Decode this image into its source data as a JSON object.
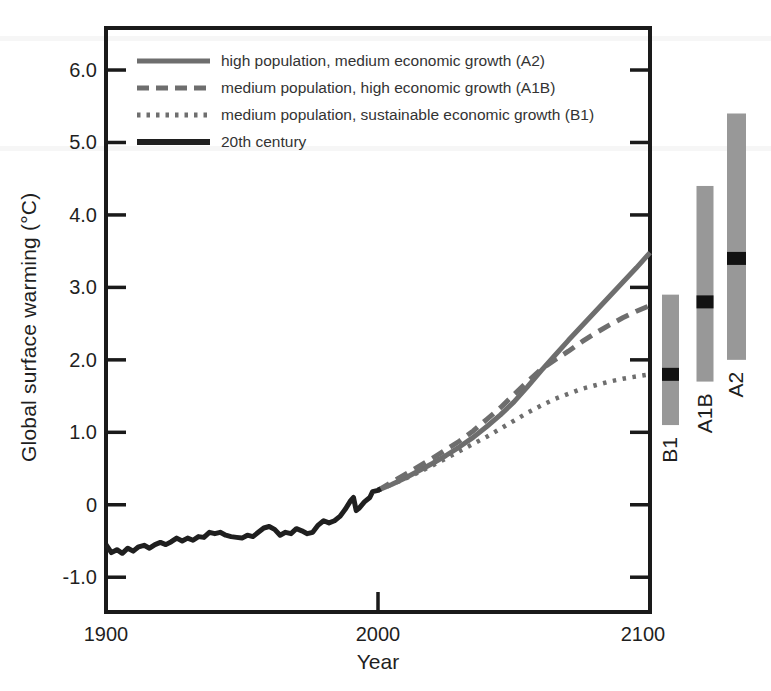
{
  "figure": {
    "background": "#ffffff",
    "axis_color": "#1a1a1a",
    "text_color": "#1f1f1f"
  },
  "axes": {
    "x_tick_labels": [
      "1900",
      "2000",
      "2100"
    ],
    "y_tick_labels": [
      "-1.0",
      "0",
      "1.0",
      "2.0",
      "3.0",
      "4.0",
      "5.0",
      "6.0"
    ]
  },
  "chart_data": {
    "type": "line",
    "title": "",
    "xlabel": "Year",
    "ylabel": "Global surface warming (°C)",
    "xlim": [
      1900,
      2100
    ],
    "ylim": [
      -1.48,
      6.58
    ],
    "x_ticks": [
      1900,
      2000,
      2100
    ],
    "y_ticks": [
      -1,
      0,
      1,
      2,
      3,
      4,
      5,
      6
    ],
    "grid": false,
    "legend_position": "top-left-inside",
    "series": [
      {
        "name": "A2",
        "label": "high population, medium economic growth (A2)",
        "style": "solid",
        "color": "#6e6e6e",
        "stroke_width": 5,
        "points": [
          [
            2000,
            0.2
          ],
          [
            2005,
            0.28
          ],
          [
            2010,
            0.37
          ],
          [
            2015,
            0.47
          ],
          [
            2020,
            0.57
          ],
          [
            2025,
            0.68
          ],
          [
            2030,
            0.8
          ],
          [
            2035,
            0.93
          ],
          [
            2040,
            1.08
          ],
          [
            2045,
            1.24
          ],
          [
            2050,
            1.42
          ],
          [
            2055,
            1.63
          ],
          [
            2060,
            1.85
          ],
          [
            2065,
            2.06
          ],
          [
            2070,
            2.27
          ],
          [
            2075,
            2.47
          ],
          [
            2080,
            2.67
          ],
          [
            2085,
            2.87
          ],
          [
            2090,
            3.07
          ],
          [
            2095,
            3.27
          ],
          [
            2100,
            3.48
          ]
        ]
      },
      {
        "name": "A1B",
        "label": "medium population, high economic growth (A1B)",
        "style": "dashed",
        "color": "#6e6e6e",
        "stroke_width": 5,
        "points": [
          [
            2000,
            0.2
          ],
          [
            2005,
            0.31
          ],
          [
            2010,
            0.42
          ],
          [
            2015,
            0.53
          ],
          [
            2020,
            0.64
          ],
          [
            2025,
            0.76
          ],
          [
            2030,
            0.88
          ],
          [
            2035,
            1.02
          ],
          [
            2040,
            1.18
          ],
          [
            2045,
            1.34
          ],
          [
            2050,
            1.52
          ],
          [
            2055,
            1.7
          ],
          [
            2060,
            1.87
          ],
          [
            2065,
            2.0
          ],
          [
            2070,
            2.12
          ],
          [
            2075,
            2.25
          ],
          [
            2080,
            2.37
          ],
          [
            2085,
            2.48
          ],
          [
            2090,
            2.58
          ],
          [
            2095,
            2.67
          ],
          [
            2100,
            2.75
          ]
        ]
      },
      {
        "name": "B1",
        "label": "medium population, sustainable economic growth (B1)",
        "style": "dotted",
        "color": "#6e6e6e",
        "stroke_width": 4.5,
        "points": [
          [
            2000,
            0.2
          ],
          [
            2005,
            0.28
          ],
          [
            2010,
            0.36
          ],
          [
            2015,
            0.45
          ],
          [
            2020,
            0.54
          ],
          [
            2025,
            0.64
          ],
          [
            2030,
            0.74
          ],
          [
            2035,
            0.84
          ],
          [
            2040,
            0.94
          ],
          [
            2045,
            1.05
          ],
          [
            2050,
            1.16
          ],
          [
            2055,
            1.27
          ],
          [
            2060,
            1.37
          ],
          [
            2065,
            1.46
          ],
          [
            2070,
            1.53
          ],
          [
            2075,
            1.6
          ],
          [
            2080,
            1.65
          ],
          [
            2085,
            1.7
          ],
          [
            2090,
            1.74
          ],
          [
            2095,
            1.77
          ],
          [
            2100,
            1.8
          ]
        ]
      },
      {
        "name": "20th century",
        "label": "20th century",
        "style": "solid",
        "color": "#1f1f1f",
        "stroke_width": 5,
        "points": [
          [
            1900,
            -0.55
          ],
          [
            1902,
            -0.66
          ],
          [
            1904,
            -0.62
          ],
          [
            1906,
            -0.67
          ],
          [
            1908,
            -0.6
          ],
          [
            1910,
            -0.64
          ],
          [
            1912,
            -0.58
          ],
          [
            1914,
            -0.56
          ],
          [
            1916,
            -0.6
          ],
          [
            1918,
            -0.55
          ],
          [
            1920,
            -0.52
          ],
          [
            1922,
            -0.55
          ],
          [
            1924,
            -0.51
          ],
          [
            1926,
            -0.46
          ],
          [
            1928,
            -0.5
          ],
          [
            1930,
            -0.46
          ],
          [
            1932,
            -0.49
          ],
          [
            1934,
            -0.44
          ],
          [
            1936,
            -0.45
          ],
          [
            1938,
            -0.38
          ],
          [
            1940,
            -0.4
          ],
          [
            1942,
            -0.38
          ],
          [
            1944,
            -0.42
          ],
          [
            1946,
            -0.44
          ],
          [
            1948,
            -0.45
          ],
          [
            1950,
            -0.46
          ],
          [
            1952,
            -0.42
          ],
          [
            1954,
            -0.44
          ],
          [
            1956,
            -0.38
          ],
          [
            1958,
            -0.32
          ],
          [
            1960,
            -0.3
          ],
          [
            1962,
            -0.34
          ],
          [
            1964,
            -0.42
          ],
          [
            1966,
            -0.38
          ],
          [
            1968,
            -0.4
          ],
          [
            1970,
            -0.33
          ],
          [
            1972,
            -0.36
          ],
          [
            1974,
            -0.4
          ],
          [
            1976,
            -0.38
          ],
          [
            1978,
            -0.28
          ],
          [
            1980,
            -0.22
          ],
          [
            1982,
            -0.25
          ],
          [
            1984,
            -0.22
          ],
          [
            1986,
            -0.16
          ],
          [
            1988,
            -0.06
          ],
          [
            1990,
            0.06
          ],
          [
            1991,
            0.1
          ],
          [
            1992,
            -0.08
          ],
          [
            1993,
            -0.05
          ],
          [
            1995,
            0.04
          ],
          [
            1997,
            0.1
          ],
          [
            1998,
            0.18
          ],
          [
            2000,
            0.2
          ],
          [
            2001,
            0.22
          ]
        ]
      }
    ],
    "range_bars": [
      {
        "label": "B1",
        "min": 1.1,
        "max": 2.9,
        "best": 1.8,
        "color": "#989898",
        "mark_color": "#121212"
      },
      {
        "label": "A1B",
        "min": 1.7,
        "max": 4.4,
        "best": 2.8,
        "color": "#989898",
        "mark_color": "#121212"
      },
      {
        "label": "A2",
        "min": 2.0,
        "max": 5.4,
        "best": 3.4,
        "color": "#989898",
        "mark_color": "#121212"
      }
    ]
  }
}
